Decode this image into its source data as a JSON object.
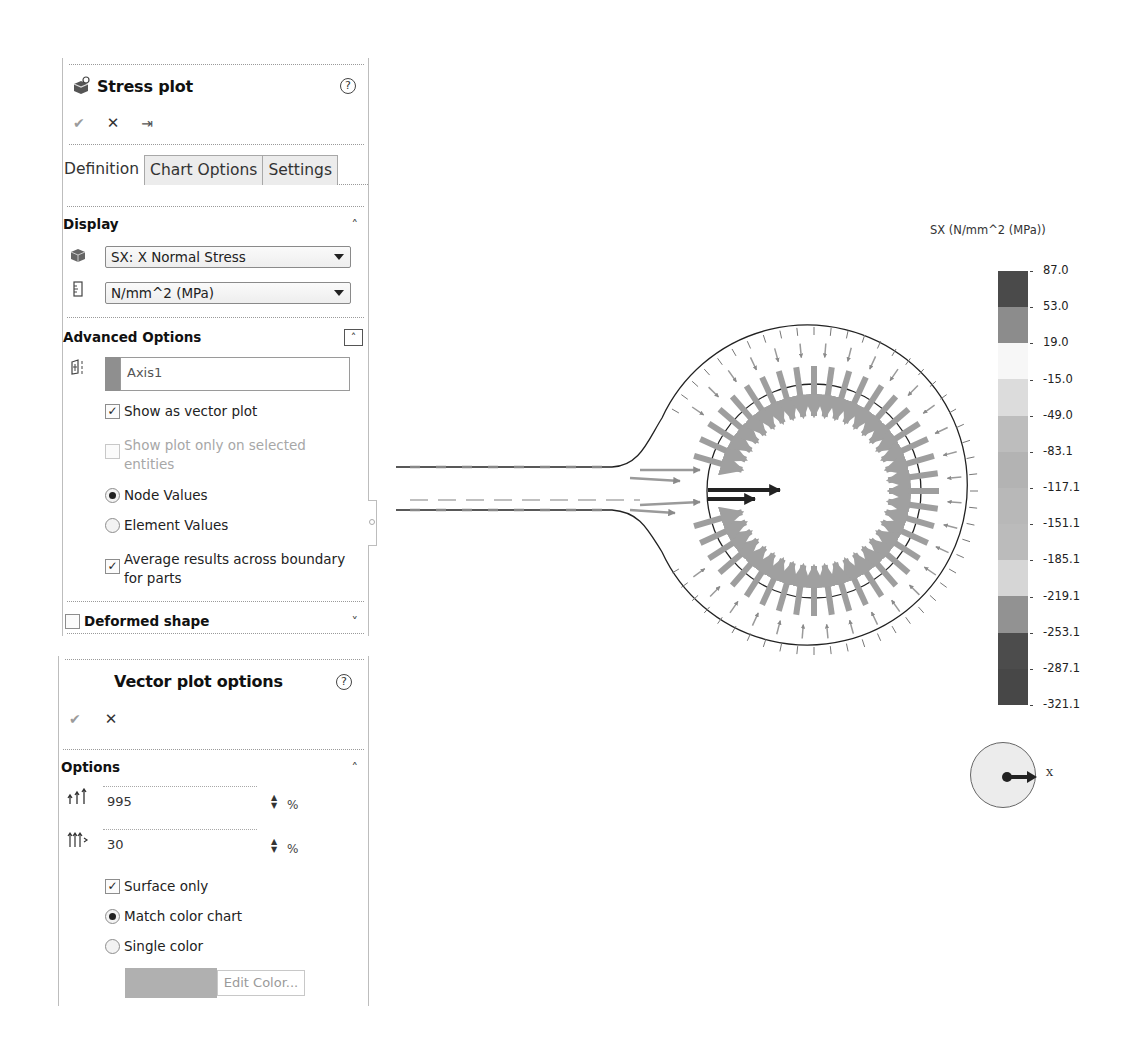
{
  "stress_panel": {
    "title": "Stress plot",
    "help_icon": "?",
    "actions": {
      "ok": "✔",
      "cancel": "✕",
      "pin": "⇥"
    },
    "tabs": [
      {
        "label": "Definition",
        "active": true
      },
      {
        "label": "Chart Options",
        "active": false
      },
      {
        "label": "Settings",
        "active": false
      }
    ],
    "display": {
      "title": "Display",
      "component": "SX: X Normal Stress",
      "units": "N/mm^2 (MPa)"
    },
    "advanced": {
      "title": "Advanced Options",
      "axis_value": "Axis1",
      "show_vector": "Show as vector plot",
      "show_vector_checked": true,
      "show_selected": "Show plot only on selected entities",
      "show_selected_checked": false,
      "node_values": "Node Values",
      "element_values": "Element Values",
      "selected_radio": "node_values",
      "average_results": "Average results across boundary for parts",
      "average_results_checked": true
    },
    "deformed": {
      "title": "Deformed shape",
      "checked": false
    }
  },
  "vector_panel": {
    "title": "Vector plot options",
    "help_icon": "?",
    "actions": {
      "ok": "✔",
      "cancel": "✕"
    },
    "options_title": "Options",
    "size_value": "995",
    "size_unit": "%",
    "density_value": "30",
    "density_unit": "%",
    "surface_only": "Surface only",
    "surface_only_checked": true,
    "match_color": "Match color chart",
    "single_color": "Single color",
    "selected_radio": "match_color",
    "edit_color": "Edit Color..."
  },
  "legend": {
    "title": "SX (N/mm^2 (MPa))",
    "labels": [
      "87.0",
      "53.0",
      "19.0",
      "-15.0",
      "-49.0",
      "-83.1",
      "-117.1",
      "-151.1",
      "-185.1",
      "-219.1",
      "-253.1",
      "-287.1",
      "-321.1"
    ],
    "colors": [
      "#4a4a4a",
      "#8c8c8c",
      "#f7f7f7",
      "#dcdcdc",
      "#bdbdbd",
      "#b3b3b3",
      "#b8b8b8",
      "#bbbbbb",
      "#d6d6d6",
      "#929292",
      "#4c4c4c",
      "#474747"
    ]
  },
  "triad": {
    "axis_label": "X"
  }
}
